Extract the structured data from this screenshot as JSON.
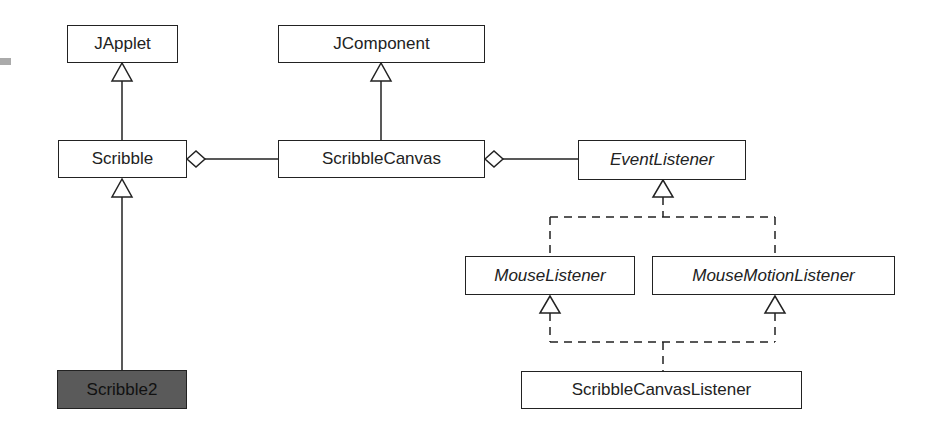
{
  "diagram": {
    "type": "UML class diagram",
    "classes": [
      {
        "id": "japplet",
        "label": "JApplet",
        "abstract": false
      },
      {
        "id": "jcomponent",
        "label": "JComponent",
        "abstract": false
      },
      {
        "id": "scribble",
        "label": "Scribble",
        "abstract": false
      },
      {
        "id": "scribblecanvas",
        "label": "ScribbleCanvas",
        "abstract": false
      },
      {
        "id": "eventlistener",
        "label": "EventListener",
        "abstract": true
      },
      {
        "id": "mouselistener",
        "label": "MouseListener",
        "abstract": true
      },
      {
        "id": "mousemotionlistener",
        "label": "MouseMotionListener",
        "abstract": true
      },
      {
        "id": "scribble2",
        "label": "Scribble2",
        "abstract": false,
        "highlighted": true
      },
      {
        "id": "scribblecanvaslistener",
        "label": "ScribbleCanvasListener",
        "abstract": false
      }
    ],
    "relations": [
      {
        "from": "Scribble",
        "to": "JApplet",
        "kind": "generalization"
      },
      {
        "from": "ScribbleCanvas",
        "to": "JComponent",
        "kind": "generalization"
      },
      {
        "from": "Scribble2",
        "to": "Scribble",
        "kind": "generalization"
      },
      {
        "from": "Scribble",
        "to": "ScribbleCanvas",
        "kind": "aggregation"
      },
      {
        "from": "ScribbleCanvas",
        "to": "EventListener",
        "kind": "aggregation"
      },
      {
        "from": "MouseListener",
        "to": "EventListener",
        "kind": "realization"
      },
      {
        "from": "MouseMotionListener",
        "to": "EventListener",
        "kind": "realization"
      },
      {
        "from": "ScribbleCanvasListener",
        "to": "MouseListener",
        "kind": "realization"
      },
      {
        "from": "ScribbleCanvasListener",
        "to": "MouseMotionListener",
        "kind": "realization"
      }
    ],
    "colors": {
      "line": "#222222",
      "highlight_fill": "#5a5a5a"
    }
  }
}
